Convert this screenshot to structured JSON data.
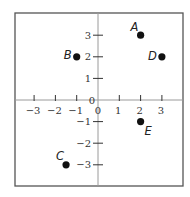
{
  "chart_data": {
    "type": "scatter",
    "title": "",
    "xlabel": "",
    "ylabel": "",
    "xlim": [
      -3.9,
      4
    ],
    "ylim": [
      -4,
      4
    ],
    "grid": false,
    "x_ticks": [
      -3,
      -2,
      -1,
      0,
      1,
      2,
      3
    ],
    "y_ticks": [
      -3,
      -2,
      -1,
      0,
      1,
      2,
      3
    ],
    "x_tick_labels": [
      "−3",
      "−2",
      "−1",
      "0",
      "1",
      "2",
      "3"
    ],
    "y_tick_labels": [
      "−3",
      "−2",
      "−1",
      "0",
      "1",
      "2",
      "3"
    ],
    "points": [
      {
        "label": "A",
        "x": 2,
        "y": 3
      },
      {
        "label": "B",
        "x": -1,
        "y": 2
      },
      {
        "label": "C",
        "x": -1.5,
        "y": -3
      },
      {
        "label": "D",
        "x": 3,
        "y": 2
      },
      {
        "label": "E",
        "x": 2,
        "y": -1
      }
    ]
  },
  "colors": {
    "frame": "#555555",
    "axis": "#9a9a9a",
    "point": "#111111"
  }
}
